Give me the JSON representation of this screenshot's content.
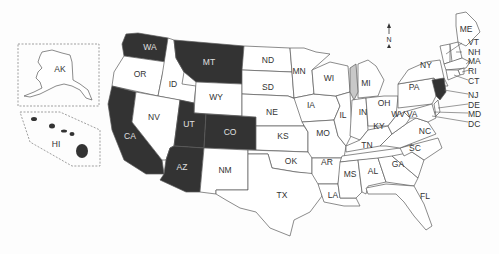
{
  "map": {
    "colors": {
      "highlighted": "#333333",
      "default": "#ffffff",
      "water": "#c8c8c8",
      "label_dark": "#e0e0e0",
      "label_light": "#333333",
      "border": "#5a5a5a"
    },
    "compass": {
      "label": "N"
    },
    "insets": [
      {
        "code": "AK",
        "highlighted": false
      },
      {
        "code": "HI",
        "highlighted": false
      }
    ],
    "highlighted_states": [
      "WA",
      "MT",
      "CA",
      "UT",
      "CO",
      "AZ",
      "NJ"
    ],
    "states": [
      {
        "code": "WA",
        "highlighted": true
      },
      {
        "code": "OR",
        "highlighted": false
      },
      {
        "code": "CA",
        "highlighted": true
      },
      {
        "code": "ID",
        "highlighted": false
      },
      {
        "code": "NV",
        "highlighted": false
      },
      {
        "code": "MT",
        "highlighted": true
      },
      {
        "code": "WY",
        "highlighted": false
      },
      {
        "code": "UT",
        "highlighted": true
      },
      {
        "code": "CO",
        "highlighted": true
      },
      {
        "code": "AZ",
        "highlighted": true
      },
      {
        "code": "NM",
        "highlighted": false
      },
      {
        "code": "ND",
        "highlighted": false
      },
      {
        "code": "SD",
        "highlighted": false
      },
      {
        "code": "NE",
        "highlighted": false
      },
      {
        "code": "KS",
        "highlighted": false
      },
      {
        "code": "OK",
        "highlighted": false
      },
      {
        "code": "TX",
        "highlighted": false
      },
      {
        "code": "MN",
        "highlighted": false
      },
      {
        "code": "IA",
        "highlighted": false
      },
      {
        "code": "MO",
        "highlighted": false
      },
      {
        "code": "AR",
        "highlighted": false
      },
      {
        "code": "LA",
        "highlighted": false
      },
      {
        "code": "WI",
        "highlighted": false
      },
      {
        "code": "IL",
        "highlighted": false
      },
      {
        "code": "MI",
        "highlighted": false
      },
      {
        "code": "IN",
        "highlighted": false
      },
      {
        "code": "OH",
        "highlighted": false
      },
      {
        "code": "KY",
        "highlighted": false
      },
      {
        "code": "TN",
        "highlighted": false
      },
      {
        "code": "MS",
        "highlighted": false
      },
      {
        "code": "AL",
        "highlighted": false
      },
      {
        "code": "GA",
        "highlighted": false
      },
      {
        "code": "FL",
        "highlighted": false
      },
      {
        "code": "SC",
        "highlighted": false
      },
      {
        "code": "NC",
        "highlighted": false
      },
      {
        "code": "VA",
        "highlighted": false
      },
      {
        "code": "WV",
        "highlighted": false
      },
      {
        "code": "PA",
        "highlighted": false
      },
      {
        "code": "NY",
        "highlighted": false
      },
      {
        "code": "ME",
        "highlighted": false
      },
      {
        "code": "VT",
        "highlighted": false
      },
      {
        "code": "NH",
        "highlighted": false
      },
      {
        "code": "MA",
        "highlighted": false
      },
      {
        "code": "RI",
        "highlighted": false
      },
      {
        "code": "CT",
        "highlighted": false
      },
      {
        "code": "NJ",
        "highlighted": true
      },
      {
        "code": "DE",
        "highlighted": false
      },
      {
        "code": "MD",
        "highlighted": false
      },
      {
        "code": "DC",
        "highlighted": false
      }
    ],
    "callout_labels": [
      "VT",
      "NH",
      "MA",
      "RI",
      "CT",
      "NJ",
      "DE",
      "MD",
      "DC"
    ]
  }
}
